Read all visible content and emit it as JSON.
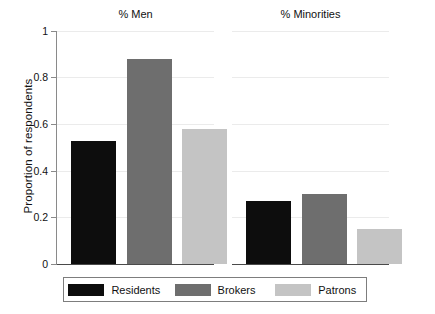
{
  "chart_data": {
    "type": "bar",
    "title": "",
    "xlabel": "",
    "ylabel": "Proportion of respondents",
    "ylim": [
      0,
      1
    ],
    "ytick_labels": [
      "0",
      "0.2",
      "0.4",
      "0.6",
      "0.8",
      "1"
    ],
    "ytick_values": [
      0,
      0.2,
      0.4,
      0.6,
      0.8,
      1
    ],
    "grid": true,
    "legend_position": "bottom",
    "panels": [
      {
        "title": "% Men",
        "categories": [
          "Residents",
          "Brokers",
          "Patrons"
        ],
        "values": [
          0.53,
          0.88,
          0.58
        ]
      },
      {
        "title": "% Minorities",
        "categories": [
          "Residents",
          "Brokers",
          "Patrons"
        ],
        "values": [
          0.27,
          0.3,
          0.15
        ]
      }
    ],
    "series": [
      {
        "name": "Residents",
        "color": "#0d0d0d",
        "values": [
          0.53,
          0.27
        ]
      },
      {
        "name": "Brokers",
        "color": "#6e6e6e",
        "values": [
          0.88,
          0.3
        ]
      },
      {
        "name": "Patrons",
        "color": "#c4c4c4",
        "values": [
          0.58,
          0.15
        ]
      }
    ],
    "legend": [
      {
        "label": "Residents",
        "color": "#0d0d0d"
      },
      {
        "label": "Brokers",
        "color": "#6e6e6e"
      },
      {
        "label": "Patrons",
        "color": "#c4c4c4"
      }
    ]
  }
}
